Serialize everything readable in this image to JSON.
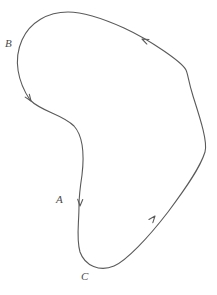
{
  "figure": {
    "name": "oriented-closed-curve",
    "background_color": "#ffffff",
    "stroke_color": "#5a5a5a",
    "label_color": "#4a4a4a",
    "stroke_width": 1.1,
    "orientation": "clockwise",
    "width": 217,
    "height": 295
  },
  "labels": [
    {
      "id": "label-A",
      "text": "A",
      "x": 56,
      "y": 194,
      "near_point": {
        "x": 80,
        "y": 201
      }
    },
    {
      "id": "label-B",
      "text": "B",
      "x": 5,
      "y": 38,
      "near_point": {
        "x": 22,
        "y": 47
      }
    },
    {
      "id": "label-C",
      "text": "C",
      "x": 81,
      "y": 271,
      "near_point": {
        "x": 88,
        "y": 268
      }
    }
  ],
  "curve": {
    "path": "M 68 12 C 48 12 30 22 22 40 C 13 60 18 82 30 100 C 42 112 62 114 74 126 C 84 137 84 158 82 175 C 80 188 79 196 79 206 C 79 224 76 238 80 252 C 85 266 100 272 114 266 C 126 261 148 238 168 212 C 186 188 200 168 205 152 C 208 142 200 118 193 96 C 188 80 188 74 186 70 C 182 62 150 40 124 28 C 104 19 84 12 68 12 Z",
    "closed": true
  },
  "arrows": [
    {
      "id": "arrow-top-right",
      "at": {
        "x": 142,
        "y": 39
      },
      "direction_degrees": 205,
      "description": "arrowhead on upper-right segment pointing up-left toward the top of the curve"
    },
    {
      "id": "arrow-left-B",
      "at": {
        "x": 31,
        "y": 101
      },
      "direction_degrees": 55,
      "description": "arrowhead on left side below B pointing down-right"
    },
    {
      "id": "arrow-A",
      "at": {
        "x": 80,
        "y": 206
      },
      "direction_degrees": 92,
      "description": "arrowhead next to A pointing straight down"
    },
    {
      "id": "arrow-bottom-right",
      "at": {
        "x": 155,
        "y": 216
      },
      "direction_degrees": 309,
      "description": "arrowhead on lower-right segment pointing up-right"
    }
  ]
}
